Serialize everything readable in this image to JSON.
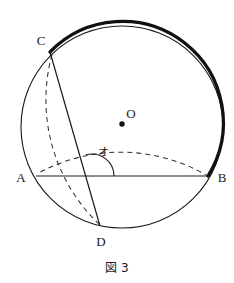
{
  "figure": {
    "caption": "図 3",
    "caption_position": {
      "x": 117,
      "y": 268
    },
    "canvas": {
      "width": 234,
      "height": 283,
      "background": "#ffffff"
    },
    "colors": {
      "stroke": "#1a1a1a",
      "thick_arc": "#111111",
      "dashed": "#333333",
      "label": "#1a1a1a",
      "background": "#ffffff"
    }
  },
  "circle": {
    "name": "main-circle",
    "center": {
      "x": 122,
      "y": 127
    },
    "radius": 101,
    "stroke_width": 1.1,
    "style": "solid"
  },
  "highlight_arc": {
    "name": "bold-arc-C-to-B",
    "description": "thick arc along the circle from C clockwise through top to B",
    "start_point": "C",
    "end_point": "B",
    "stroke_width": 3.2
  },
  "points": [
    {
      "id": "A",
      "label": "A",
      "x": 36,
      "y": 176,
      "label_x": 21,
      "label_y": 177,
      "dot": false
    },
    {
      "id": "B",
      "label": "B",
      "x": 208,
      "y": 176,
      "label_x": 222,
      "label_y": 177,
      "dot": false
    },
    {
      "id": "C",
      "label": "C",
      "x": 50,
      "y": 52,
      "label_x": 41,
      "label_y": 40,
      "dot": false
    },
    {
      "id": "D",
      "label": "D",
      "x": 100,
      "y": 226,
      "label_x": 101,
      "label_y": 241,
      "dot": false
    },
    {
      "id": "O",
      "label": "O",
      "x": 122,
      "y": 124,
      "label_x": 131,
      "label_y": 113,
      "dot": true,
      "dot_radius": 2.6
    }
  ],
  "segments": [
    {
      "name": "chord-A-B",
      "from": "A",
      "to": "B",
      "style": "solid",
      "stroke_width": 1.2
    },
    {
      "name": "chord-C-D",
      "from": "C",
      "to": "D",
      "style": "solid",
      "stroke_width": 1.2
    }
  ],
  "construction_arcs": [
    {
      "name": "dashed-arc-center-A-through-O-to-B",
      "center": "A",
      "radius": 172,
      "style": "dashed",
      "description": "compass arc centered at A with radius AB, passing through O, ending at B"
    },
    {
      "name": "dashed-arc-center-B-through-C-O-D",
      "center": "B",
      "radius": 172,
      "style": "dashed",
      "description": "compass arc centered at B with radius BA, passing through C, O and D"
    }
  ],
  "angle_marker": {
    "name": "angle-marker-o",
    "label": "オ",
    "vertex": {
      "x": 92,
      "y": 176
    },
    "label_x": 103,
    "label_y": 152,
    "radius": 22,
    "description": "angle between ray toward B along AB and ray toward C along CD"
  }
}
